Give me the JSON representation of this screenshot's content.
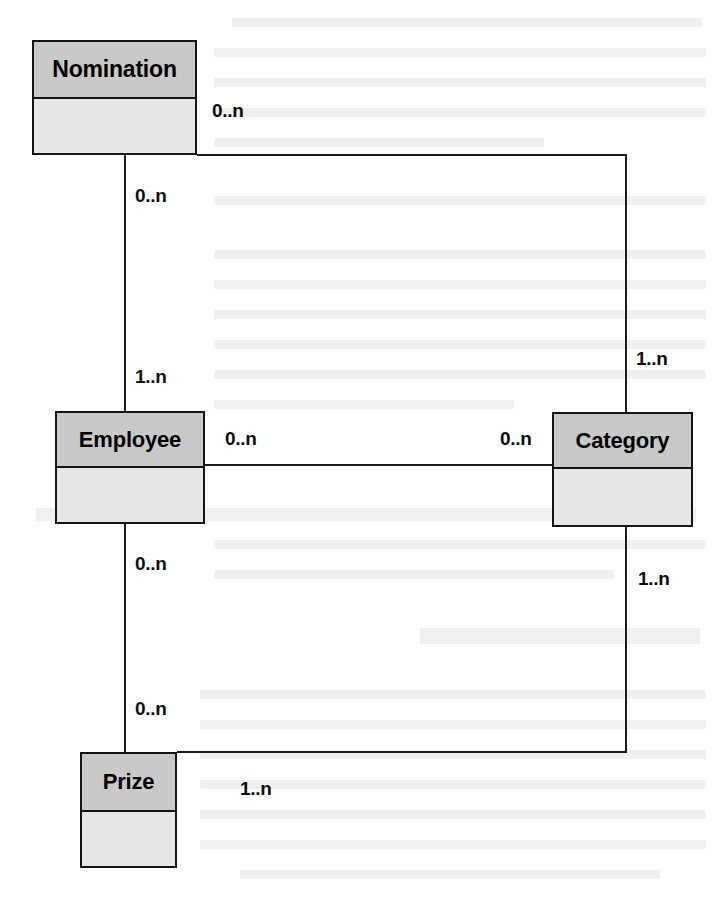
{
  "diagram": {
    "type": "uml-class-diagram",
    "background_color": "#ffffff",
    "line_color": "#1c1c1c",
    "box_header_color": "#c9c9c9",
    "box_body_color": "#e7e7e7",
    "box_border_color": "#141414",
    "classes": [
      {
        "id": "nomination",
        "name": "Nomination",
        "x": 32,
        "y": 40,
        "width": 165,
        "height": 115,
        "header_height": 57
      },
      {
        "id": "employee",
        "name": "Employee",
        "x": 55,
        "y": 411,
        "width": 150,
        "height": 113,
        "header_height": 55
      },
      {
        "id": "category",
        "name": "Category",
        "x": 552,
        "y": 412,
        "width": 141,
        "height": 115,
        "header_height": 55
      },
      {
        "id": "prize",
        "name": "Prize",
        "x": 80,
        "y": 752,
        "width": 97,
        "height": 116,
        "header_height": 58
      }
    ],
    "multiplicities": [
      {
        "id": "nomination-right",
        "text": "0..n",
        "x": 212,
        "y": 100,
        "relates": "nomination-category"
      },
      {
        "id": "nomination-bottom",
        "text": "0..n",
        "x": 135,
        "y": 185,
        "relates": "nomination-employee"
      },
      {
        "id": "employee-top",
        "text": "1..n",
        "x": 135,
        "y": 366,
        "relates": "nomination-employee"
      },
      {
        "id": "employee-right",
        "text": "0..n",
        "x": 225,
        "y": 428,
        "relates": "employee-category"
      },
      {
        "id": "category-left",
        "text": "0..n",
        "x": 500,
        "y": 428,
        "relates": "employee-category"
      },
      {
        "id": "category-top",
        "text": "1..n",
        "x": 636,
        "y": 348,
        "relates": "nomination-category"
      },
      {
        "id": "category-bottom",
        "text": "1..n",
        "x": 638,
        "y": 568,
        "relates": "category-prize"
      },
      {
        "id": "employee-bottom",
        "text": "0..n",
        "x": 135,
        "y": 553,
        "relates": "employee-prize"
      },
      {
        "id": "prize-top",
        "text": "0..n",
        "x": 135,
        "y": 698,
        "relates": "employee-prize"
      },
      {
        "id": "prize-right",
        "text": "1..n",
        "x": 240,
        "y": 778,
        "relates": "category-prize"
      }
    ],
    "connections": [
      {
        "id": "nomination-employee",
        "from": "nomination",
        "to": "employee",
        "path": "vertical",
        "x": 124,
        "y1": 155,
        "y2": 411
      },
      {
        "id": "employee-prize",
        "from": "employee",
        "to": "prize",
        "path": "vertical",
        "x": 124,
        "y1": 524,
        "y2": 752
      },
      {
        "id": "employee-category",
        "from": "employee",
        "to": "category",
        "path": "horizontal",
        "y": 465,
        "x1": 205,
        "x2": 552
      },
      {
        "id": "nomination-category",
        "from": "nomination",
        "to": "category",
        "path": "elbow",
        "y": 155,
        "x1": 197,
        "x2": 625,
        "y2": 412
      },
      {
        "id": "category-prize",
        "from": "category",
        "to": "prize",
        "path": "elbow",
        "x": 625,
        "y1": 527,
        "y2": 752,
        "x2": 177
      }
    ]
  }
}
